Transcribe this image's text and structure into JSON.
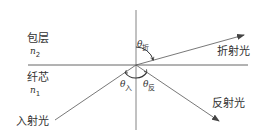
{
  "diagram": {
    "title": "",
    "regions": {
      "cladding": {
        "label": "包层",
        "index_symbol": "n",
        "index_sub": "2"
      },
      "core": {
        "label": "纤芯",
        "index_symbol": "n",
        "index_sub": "1"
      }
    },
    "rays": {
      "incident": {
        "label": "入射光"
      },
      "refracted": {
        "label": "折射光"
      },
      "reflected": {
        "label": "反射光"
      }
    },
    "angles": {
      "refraction": {
        "symbol": "θ",
        "sub": "折"
      },
      "incidence": {
        "symbol": "θ",
        "sub": "入"
      },
      "reflection": {
        "symbol": "θ",
        "sub": "反"
      }
    },
    "colors": {
      "line": "#555555",
      "text": "#333333"
    }
  }
}
